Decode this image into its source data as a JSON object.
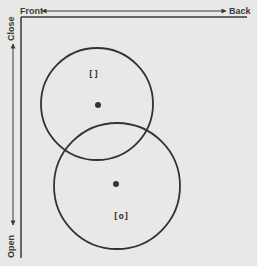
{
  "axes": {
    "horizontal": {
      "left_label": "Front",
      "right_label": "Back"
    },
    "vertical": {
      "top_label": "Close",
      "bottom_label": "Open"
    }
  },
  "circles": [
    {
      "name": "upper",
      "cx": 97,
      "cy": 104,
      "r": 56,
      "marker": "[]"
    },
    {
      "name": "lower",
      "cx": 117,
      "cy": 186,
      "r": 63,
      "marker": "[o]"
    }
  ],
  "colors": {
    "line": "#3a3a3a",
    "background": "#e8e8e6"
  }
}
